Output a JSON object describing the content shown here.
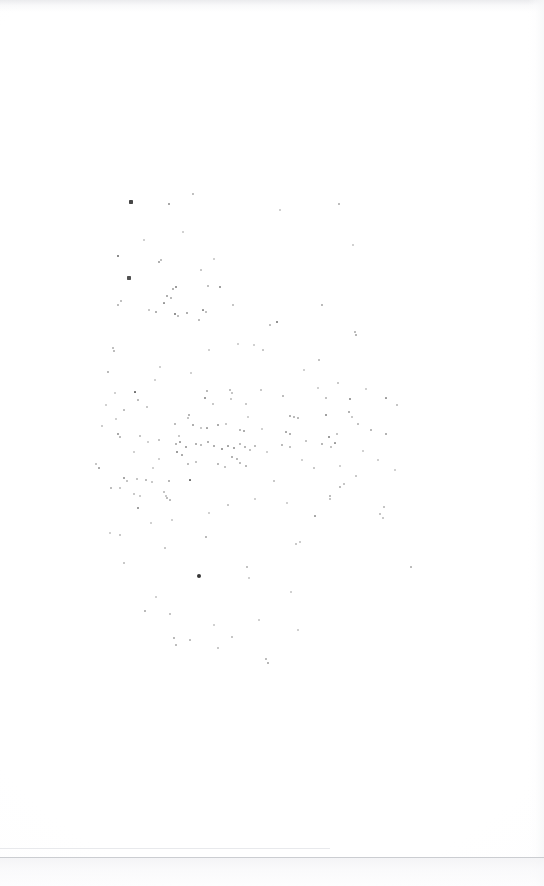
{
  "document": {
    "type": "scanned-page",
    "title": "Blank scanned page",
    "description": "Near-blank white scanned book page with scattered ink specks and dust particles",
    "visible_text": "",
    "page_width": 544,
    "page_height": 886,
    "background_color": "#ffffff",
    "speck_color": "#2b2b2b"
  },
  "artifacts": {
    "top_edge_shadow": {
      "label": "top-edge-shadow",
      "y": 0,
      "height": 12,
      "color": "#e4e5e8"
    },
    "right_edge_shadow": {
      "label": "right-edge-shadow",
      "x": 528,
      "width": 16,
      "color": "#f6f7f8"
    },
    "crease_line": {
      "label": "crease-line",
      "x": 0,
      "y": 848,
      "width": 330,
      "color": "#e8e9ec"
    },
    "page_bottom_edge": {
      "label": "page-bottom-edge",
      "y": 857,
      "color": "#cbcdd1"
    },
    "below_page_tone": {
      "label": "below-page-tone",
      "y": 858,
      "height": 28,
      "color": "#f3f3f5"
    }
  },
  "speck_field": {
    "label": "ink-speck-field",
    "count": 196,
    "bounds": {
      "x": 95,
      "y": 175,
      "width": 320,
      "height": 500
    },
    "densest_region": {
      "x": 160,
      "y": 400,
      "width": 130,
      "height": 110
    },
    "largest_speck": {
      "x": 199,
      "y": 576,
      "size": 4.2
    },
    "specks": [
      [
        131,
        202,
        1.9,
        0.88
      ],
      [
        169,
        204,
        1.1,
        0.55
      ],
      [
        193,
        194,
        0.9,
        0.38
      ],
      [
        339,
        204,
        0.9,
        0.4
      ],
      [
        118,
        256,
        1.4,
        0.72
      ],
      [
        159,
        262,
        1.0,
        0.5
      ],
      [
        161,
        260,
        0.8,
        0.36
      ],
      [
        129,
        278,
        1.6,
        0.82
      ],
      [
        173,
        289,
        0.9,
        0.45
      ],
      [
        176,
        287,
        1.2,
        0.62
      ],
      [
        208,
        286,
        0.8,
        0.35
      ],
      [
        220,
        287,
        1.2,
        0.6
      ],
      [
        167,
        296,
        1.0,
        0.5
      ],
      [
        171,
        298,
        0.9,
        0.42
      ],
      [
        164,
        303,
        1.1,
        0.52
      ],
      [
        175,
        314,
        1.3,
        0.68
      ],
      [
        178,
        316,
        0.9,
        0.4
      ],
      [
        121,
        301,
        0.8,
        0.35
      ],
      [
        118,
        305,
        0.9,
        0.4
      ],
      [
        156,
        312,
        1.0,
        0.48
      ],
      [
        187,
        313,
        1.0,
        0.5
      ],
      [
        203,
        310,
        1.1,
        0.55
      ],
      [
        206,
        312,
        0.8,
        0.35
      ],
      [
        322,
        305,
        0.9,
        0.42
      ],
      [
        233,
        305,
        0.8,
        0.32
      ],
      [
        149,
        310,
        0.8,
        0.3
      ],
      [
        199,
        320,
        0.9,
        0.4
      ],
      [
        277,
        322,
        1.3,
        0.68
      ],
      [
        270,
        325,
        0.7,
        0.3
      ],
      [
        355,
        332,
        0.9,
        0.4
      ],
      [
        356,
        335,
        1.0,
        0.46
      ],
      [
        113,
        348,
        0.8,
        0.36
      ],
      [
        114,
        351,
        0.9,
        0.4
      ],
      [
        108,
        372,
        0.9,
        0.42
      ],
      [
        319,
        360,
        0.8,
        0.34
      ],
      [
        135,
        392,
        1.3,
        0.68
      ],
      [
        207,
        391,
        0.9,
        0.42
      ],
      [
        230,
        390,
        0.8,
        0.35
      ],
      [
        232,
        393,
        0.8,
        0.32
      ],
      [
        205,
        398,
        1.2,
        0.6
      ],
      [
        326,
        398,
        0.8,
        0.34
      ],
      [
        350,
        399,
        1.2,
        0.6
      ],
      [
        386,
        398,
        1.0,
        0.5
      ],
      [
        138,
        400,
        0.9,
        0.4
      ],
      [
        147,
        407,
        0.8,
        0.3
      ],
      [
        189,
        415,
        1.0,
        0.46
      ],
      [
        188,
        418,
        0.8,
        0.33
      ],
      [
        290,
        416,
        1.0,
        0.48
      ],
      [
        294,
        417,
        0.9,
        0.42
      ],
      [
        298,
        418,
        0.8,
        0.33
      ],
      [
        326,
        415,
        1.2,
        0.6
      ],
      [
        349,
        412,
        1.0,
        0.48
      ],
      [
        175,
        424,
        0.9,
        0.4
      ],
      [
        193,
        425,
        1.0,
        0.5
      ],
      [
        218,
        425,
        1.1,
        0.52
      ],
      [
        226,
        424,
        0.8,
        0.3
      ],
      [
        207,
        428,
        1.0,
        0.46
      ],
      [
        240,
        430,
        0.9,
        0.42
      ],
      [
        244,
        431,
        1.0,
        0.5
      ],
      [
        118,
        434,
        1.1,
        0.55
      ],
      [
        120,
        437,
        0.9,
        0.4
      ],
      [
        140,
        436,
        0.8,
        0.32
      ],
      [
        159,
        440,
        0.8,
        0.33
      ],
      [
        286,
        432,
        0.9,
        0.4
      ],
      [
        290,
        434,
        1.0,
        0.48
      ],
      [
        329,
        437,
        1.2,
        0.62
      ],
      [
        337,
        434,
        0.8,
        0.33
      ],
      [
        371,
        430,
        0.9,
        0.42
      ],
      [
        386,
        434,
        1.0,
        0.48
      ],
      [
        176,
        444,
        1.0,
        0.46
      ],
      [
        180,
        442,
        0.9,
        0.42
      ],
      [
        186,
        447,
        1.1,
        0.54
      ],
      [
        196,
        444,
        1.0,
        0.48
      ],
      [
        201,
        445,
        0.9,
        0.4
      ],
      [
        208,
        442,
        1.0,
        0.48
      ],
      [
        214,
        446,
        1.0,
        0.5
      ],
      [
        222,
        449,
        1.2,
        0.6
      ],
      [
        228,
        446,
        0.9,
        0.42
      ],
      [
        234,
        448,
        1.1,
        0.55
      ],
      [
        240,
        444,
        0.9,
        0.4
      ],
      [
        245,
        447,
        1.0,
        0.46
      ],
      [
        250,
        450,
        0.8,
        0.34
      ],
      [
        255,
        446,
        0.9,
        0.4
      ],
      [
        177,
        452,
        1.2,
        0.62
      ],
      [
        182,
        455,
        0.9,
        0.4
      ],
      [
        232,
        457,
        1.0,
        0.48
      ],
      [
        237,
        459,
        0.9,
        0.42
      ],
      [
        282,
        445,
        0.9,
        0.42
      ],
      [
        290,
        447,
        0.8,
        0.34
      ],
      [
        306,
        441,
        0.8,
        0.33
      ],
      [
        322,
        444,
        1.0,
        0.46
      ],
      [
        335,
        443,
        1.0,
        0.5
      ],
      [
        331,
        447,
        0.8,
        0.33
      ],
      [
        188,
        464,
        0.9,
        0.4
      ],
      [
        196,
        462,
        0.8,
        0.33
      ],
      [
        218,
        464,
        0.9,
        0.42
      ],
      [
        225,
        467,
        0.8,
        0.34
      ],
      [
        240,
        463,
        0.9,
        0.4
      ],
      [
        246,
        466,
        0.8,
        0.33
      ],
      [
        124,
        478,
        1.1,
        0.55
      ],
      [
        127,
        481,
        0.8,
        0.33
      ],
      [
        137,
        479,
        0.8,
        0.32
      ],
      [
        146,
        480,
        0.9,
        0.4
      ],
      [
        152,
        482,
        0.8,
        0.3
      ],
      [
        169,
        481,
        1.0,
        0.46
      ],
      [
        190,
        480,
        1.3,
        0.68
      ],
      [
        274,
        481,
        0.8,
        0.3
      ],
      [
        340,
        487,
        0.9,
        0.4
      ],
      [
        344,
        484,
        0.8,
        0.32
      ],
      [
        164,
        492,
        0.8,
        0.33
      ],
      [
        166,
        496,
        0.8,
        0.3
      ],
      [
        167,
        498,
        0.9,
        0.4
      ],
      [
        170,
        500,
        0.8,
        0.32
      ],
      [
        134,
        494,
        0.8,
        0.3
      ],
      [
        140,
        496,
        0.7,
        0.28
      ],
      [
        330,
        496,
        0.9,
        0.4
      ],
      [
        330,
        499,
        0.8,
        0.32
      ],
      [
        138,
        508,
        1.2,
        0.6
      ],
      [
        384,
        507,
        0.8,
        0.33
      ],
      [
        315,
        516,
        0.9,
        0.42
      ],
      [
        380,
        514,
        0.8,
        0.32
      ],
      [
        383,
        518,
        0.8,
        0.3
      ],
      [
        120,
        535,
        0.8,
        0.3
      ],
      [
        206,
        537,
        0.9,
        0.42
      ],
      [
        296,
        544,
        0.8,
        0.3
      ],
      [
        300,
        542,
        0.7,
        0.28
      ],
      [
        411,
        567,
        0.8,
        0.32
      ],
      [
        199,
        576,
        2.1,
        0.95
      ],
      [
        247,
        567,
        0.8,
        0.34
      ],
      [
        124,
        563,
        0.8,
        0.3
      ],
      [
        145,
        611,
        0.9,
        0.42
      ],
      [
        170,
        614,
        0.8,
        0.32
      ],
      [
        174,
        638,
        0.9,
        0.42
      ],
      [
        190,
        640,
        0.8,
        0.3
      ],
      [
        232,
        637,
        0.8,
        0.32
      ],
      [
        176,
        645,
        0.9,
        0.4
      ],
      [
        218,
        648,
        0.8,
        0.3
      ],
      [
        266,
        659,
        0.9,
        0.4
      ],
      [
        268,
        663,
        1.0,
        0.46
      ],
      [
        96,
        464,
        0.8,
        0.32
      ],
      [
        99,
        468,
        0.9,
        0.4
      ],
      [
        111,
        488,
        0.9,
        0.4
      ],
      [
        120,
        488,
        0.8,
        0.3
      ],
      [
        261,
        390,
        0.8,
        0.3
      ],
      [
        283,
        396,
        0.9,
        0.4
      ],
      [
        338,
        383,
        0.8,
        0.3
      ],
      [
        397,
        405,
        0.8,
        0.32
      ],
      [
        124,
        410,
        0.8,
        0.3
      ],
      [
        102,
        426,
        0.7,
        0.28
      ],
      [
        116,
        419,
        0.7,
        0.26
      ],
      [
        213,
        404,
        0.8,
        0.3
      ],
      [
        231,
        399,
        0.8,
        0.3
      ],
      [
        246,
        404,
        0.8,
        0.3
      ],
      [
        352,
        417,
        0.8,
        0.3
      ],
      [
        358,
        424,
        0.8,
        0.3
      ],
      [
        201,
        428,
        0.8,
        0.3
      ],
      [
        179,
        436,
        0.8,
        0.3
      ],
      [
        248,
        417,
        0.7,
        0.26
      ],
      [
        262,
        429,
        0.7,
        0.26
      ],
      [
        267,
        452,
        0.7,
        0.26
      ],
      [
        302,
        460,
        0.7,
        0.26
      ],
      [
        314,
        468,
        0.7,
        0.26
      ],
      [
        153,
        468,
        0.7,
        0.26
      ],
      [
        159,
        459,
        0.7,
        0.26
      ],
      [
        148,
        442,
        0.7,
        0.26
      ],
      [
        134,
        452,
        0.7,
        0.26
      ],
      [
        287,
        503,
        0.7,
        0.26
      ],
      [
        255,
        499,
        0.7,
        0.26
      ],
      [
        228,
        505,
        0.7,
        0.26
      ],
      [
        209,
        513,
        0.7,
        0.26
      ],
      [
        172,
        520,
        0.7,
        0.26
      ],
      [
        151,
        523,
        0.7,
        0.26
      ],
      [
        363,
        451,
        0.7,
        0.26
      ],
      [
        378,
        460,
        0.7,
        0.26
      ],
      [
        395,
        470,
        0.7,
        0.26
      ],
      [
        356,
        476,
        0.7,
        0.26
      ],
      [
        340,
        466,
        0.7,
        0.26
      ],
      [
        115,
        393,
        0.7,
        0.26
      ],
      [
        106,
        405,
        0.7,
        0.26
      ],
      [
        209,
        350,
        0.7,
        0.26
      ],
      [
        238,
        344,
        0.7,
        0.26
      ],
      [
        254,
        345,
        0.7,
        0.26
      ],
      [
        263,
        350,
        0.7,
        0.26
      ],
      [
        160,
        367,
        0.7,
        0.26
      ],
      [
        155,
        380,
        0.7,
        0.26
      ],
      [
        191,
        373,
        0.7,
        0.26
      ],
      [
        304,
        370,
        0.7,
        0.26
      ],
      [
        318,
        388,
        0.7,
        0.26
      ],
      [
        366,
        389,
        0.7,
        0.26
      ],
      [
        201,
        270,
        0.7,
        0.26
      ],
      [
        214,
        259,
        0.7,
        0.26
      ],
      [
        144,
        240,
        0.7,
        0.26
      ],
      [
        183,
        232,
        0.7,
        0.26
      ],
      [
        280,
        210,
        0.7,
        0.26
      ],
      [
        353,
        245,
        0.7,
        0.26
      ],
      [
        110,
        533,
        0.7,
        0.26
      ],
      [
        165,
        548,
        0.7,
        0.26
      ],
      [
        249,
        578,
        0.7,
        0.26
      ],
      [
        291,
        592,
        0.7,
        0.26
      ],
      [
        156,
        597,
        0.7,
        0.26
      ],
      [
        214,
        625,
        0.7,
        0.26
      ],
      [
        259,
        620,
        0.7,
        0.26
      ],
      [
        298,
        630,
        0.7,
        0.26
      ]
    ]
  }
}
